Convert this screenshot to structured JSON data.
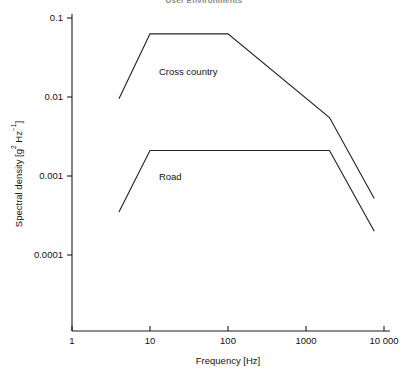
{
  "chart_data": {
    "type": "line",
    "title": "User Environments",
    "xlabel": "Frequency [Hz]",
    "ylabel": "Spectral density [g² Hz⁻¹]",
    "xscale": "log",
    "yscale": "log",
    "xlim": [
      1,
      10000
    ],
    "ylim": [
      0.0001,
      0.1
    ],
    "grid": false,
    "legend_position": "inline-annotation",
    "xticks": [
      1,
      10,
      100,
      1000,
      10000
    ],
    "xticklabels": [
      "1",
      "10",
      "100",
      "1000",
      "10 000"
    ],
    "yticks": [
      0.0001,
      0.001,
      0.01,
      0.1
    ],
    "yticklabels": [
      "0.0001",
      "0.001",
      "0.01",
      "0.1"
    ],
    "series": [
      {
        "name": "Cross country",
        "label": "Cross country",
        "color": "#242424",
        "x": [
          4,
          10,
          100,
          2000,
          7500
        ],
        "y": [
          0.0095,
          0.063,
          0.063,
          0.0055,
          0.00052
        ]
      },
      {
        "name": "Road",
        "label": "Road",
        "color": "#242424",
        "x": [
          4,
          10,
          2000,
          7500
        ],
        "y": [
          0.00035,
          0.0021,
          0.0021,
          0.0002
        ]
      }
    ],
    "annotations": [
      {
        "text": "Cross country",
        "x": 13,
        "y": 0.019
      },
      {
        "text": "Road",
        "x": 13,
        "y": 0.00088
      }
    ]
  }
}
